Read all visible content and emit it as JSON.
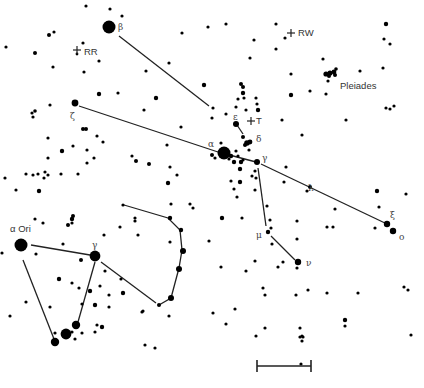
{
  "chart_title": "Star chart: Taurus / Auriga region with Orion",
  "colors": {
    "star": "#000000",
    "line": "#222222",
    "label": "#444444",
    "background": "#ffffff"
  },
  "labels": [
    {
      "id": "beta",
      "text": "β",
      "x": 118,
      "y": 30,
      "cls": "greek"
    },
    {
      "id": "zeta",
      "text": "ζ",
      "x": 70,
      "y": 119,
      "cls": "greek"
    },
    {
      "id": "alpha",
      "text": "α",
      "x": 208,
      "y": 147,
      "cls": "greek"
    },
    {
      "id": "epsilon",
      "text": "ε",
      "x": 233,
      "y": 120,
      "cls": "greek"
    },
    {
      "id": "delta",
      "text": "δ",
      "x": 256,
      "y": 142,
      "cls": "greek"
    },
    {
      "id": "gamma-tau",
      "text": "γ",
      "x": 262,
      "y": 161,
      "cls": "greek"
    },
    {
      "id": "lambda",
      "text": "λ",
      "x": 308,
      "y": 191,
      "cls": "greek"
    },
    {
      "id": "xi",
      "text": "ξ",
      "x": 390,
      "y": 218,
      "cls": "greek"
    },
    {
      "id": "omicron",
      "text": "o",
      "x": 399,
      "y": 240,
      "cls": "greek"
    },
    {
      "id": "mu",
      "text": "μ",
      "x": 256,
      "y": 238,
      "cls": "greek"
    },
    {
      "id": "nu",
      "text": "ν",
      "x": 306,
      "y": 266,
      "cls": "greek"
    },
    {
      "id": "gamma-ori",
      "text": "γ",
      "x": 92,
      "y": 248,
      "cls": "greek"
    },
    {
      "id": "alpha-ori",
      "text": "α Ori",
      "x": 10,
      "y": 232,
      "cls": "lbl-lg"
    },
    {
      "id": "rr",
      "text": "RR",
      "x": 84,
      "y": 55,
      "cls": "lbl-lg"
    },
    {
      "id": "rw",
      "text": "RW",
      "x": 298,
      "y": 36,
      "cls": "lbl-lg"
    },
    {
      "id": "t",
      "text": "T",
      "x": 256,
      "y": 124,
      "cls": "lbl-lg"
    },
    {
      "id": "pleiades",
      "text": "Pleiades",
      "x": 340,
      "y": 89,
      "cls": "lbl-lg"
    }
  ],
  "variables": [
    {
      "id": "RR",
      "x": 77,
      "y": 50
    },
    {
      "id": "RW",
      "x": 291,
      "y": 33
    },
    {
      "id": "T",
      "x": 251,
      "y": 121
    }
  ],
  "lines": [
    {
      "id": "beta-to-epsilon",
      "points": "119,36 209,106"
    },
    {
      "id": "epsilon-to-gamma-dash",
      "points": "237,125 243,134"
    },
    {
      "id": "zeta-to-alpha",
      "points": "79,106 218,152"
    },
    {
      "id": "alpha-to-gamma",
      "points": "218,152 256,162"
    },
    {
      "id": "gamma-to-xi",
      "points": "261,164 387,224"
    },
    {
      "id": "gamma-to-mu",
      "points": "258,168 266,226"
    },
    {
      "id": "mu-to-nu",
      "points": "271,236 295,260"
    },
    {
      "id": "alphaori-to-gammaori",
      "points": "31,245 90,255"
    },
    {
      "id": "alphaori-down",
      "points": "23,260 54,339"
    },
    {
      "id": "gammaori-down",
      "points": "95,262 78,322"
    },
    {
      "id": "gammaori-to-lower",
      "points": "101,262 156,303"
    },
    {
      "id": "orion-club",
      "points": "124,205 168,218 180,230 182,250 179,268 171,298 159,305"
    }
  ],
  "stars": [
    {
      "x": 109,
      "y": 27,
      "r": 6.5
    },
    {
      "x": 86,
      "y": 6,
      "r": 1.6
    },
    {
      "x": 110,
      "y": 9,
      "r": 1.6
    },
    {
      "x": 122,
      "y": 16,
      "r": 1.6
    },
    {
      "x": 49,
      "y": 35,
      "r": 2
    },
    {
      "x": 54,
      "y": 32,
      "r": 1.6
    },
    {
      "x": 35,
      "y": 53,
      "r": 2
    },
    {
      "x": 83,
      "y": 43,
      "r": 1.6
    },
    {
      "x": 77,
      "y": 54,
      "r": 1.4
    },
    {
      "x": 53,
      "y": 67,
      "r": 1.6
    },
    {
      "x": 99,
      "y": 61,
      "r": 1.6
    },
    {
      "x": 84,
      "y": 72,
      "r": 1.6
    },
    {
      "x": 169,
      "y": 63,
      "r": 1.6
    },
    {
      "x": 146,
      "y": 71,
      "r": 1.6
    },
    {
      "x": 182,
      "y": 33,
      "r": 1.6
    },
    {
      "x": 208,
      "y": 27,
      "r": 1.6
    },
    {
      "x": 204,
      "y": 85,
      "r": 2.2
    },
    {
      "x": 156,
      "y": 98,
      "r": 2.2
    },
    {
      "x": 99,
      "y": 94,
      "r": 2.2
    },
    {
      "x": 118,
      "y": 93,
      "r": 1.6
    },
    {
      "x": 75,
      "y": 103,
      "r": 3.4
    },
    {
      "x": 50,
      "y": 105,
      "r": 1.6
    },
    {
      "x": 35,
      "y": 111,
      "r": 1.8
    },
    {
      "x": 32,
      "y": 113,
      "r": 1.6
    },
    {
      "x": 33,
      "y": 117,
      "r": 1.6
    },
    {
      "x": 144,
      "y": 110,
      "r": 1.6
    },
    {
      "x": 181,
      "y": 127,
      "r": 1.6
    },
    {
      "x": 167,
      "y": 145,
      "r": 1.6
    },
    {
      "x": 83,
      "y": 129,
      "r": 2
    },
    {
      "x": 86,
      "y": 129,
      "r": 2
    },
    {
      "x": 97,
      "y": 136,
      "r": 1.6
    },
    {
      "x": 103,
      "y": 142,
      "r": 1.6
    },
    {
      "x": 48,
      "y": 138,
      "r": 1.6
    },
    {
      "x": 73,
      "y": 146,
      "r": 1.6
    },
    {
      "x": 62,
      "y": 151,
      "r": 2.2
    },
    {
      "x": 48,
      "y": 158,
      "r": 1.6
    },
    {
      "x": 132,
      "y": 156,
      "r": 1.6
    },
    {
      "x": 136,
      "y": 161,
      "r": 2
    },
    {
      "x": 149,
      "y": 164,
      "r": 2
    },
    {
      "x": 87,
      "y": 163,
      "r": 1.6
    },
    {
      "x": 94,
      "y": 158,
      "r": 1.6
    },
    {
      "x": 78,
      "y": 174,
      "r": 1.6
    },
    {
      "x": 170,
      "y": 167,
      "r": 1.6
    },
    {
      "x": 177,
      "y": 175,
      "r": 1.6
    },
    {
      "x": 168,
      "y": 183,
      "r": 2.2
    },
    {
      "x": 33,
      "y": 175,
      "r": 1.6
    },
    {
      "x": 38,
      "y": 174,
      "r": 1.6
    },
    {
      "x": 45,
      "y": 172,
      "r": 1.6
    },
    {
      "x": 44,
      "y": 178,
      "r": 1.6
    },
    {
      "x": 16,
      "y": 190,
      "r": 1.6
    },
    {
      "x": 39,
      "y": 191,
      "r": 2.2
    },
    {
      "x": 61,
      "y": 174,
      "r": 1.6
    },
    {
      "x": 87,
      "y": 150,
      "r": 1.6
    },
    {
      "x": 48,
      "y": 175,
      "r": 1.6
    },
    {
      "x": 26,
      "y": 174,
      "r": 1.6
    },
    {
      "x": 224,
      "y": 153,
      "r": 6.5
    },
    {
      "x": 212,
      "y": 155,
      "r": 2
    },
    {
      "x": 215,
      "y": 158,
      "r": 1.6
    },
    {
      "x": 231,
      "y": 156,
      "r": 2.2
    },
    {
      "x": 234,
      "y": 162,
      "r": 2.2
    },
    {
      "x": 229,
      "y": 159,
      "r": 1.6
    },
    {
      "x": 236,
      "y": 151,
      "r": 1.6
    },
    {
      "x": 241,
      "y": 162,
      "r": 2.2
    },
    {
      "x": 221,
      "y": 143,
      "r": 1.6
    },
    {
      "x": 212,
      "y": 118,
      "r": 1.6
    },
    {
      "x": 238,
      "y": 156,
      "r": 1.6
    },
    {
      "x": 243,
      "y": 160,
      "r": 1.6
    },
    {
      "x": 236,
      "y": 124,
      "r": 3
    },
    {
      "x": 243,
      "y": 137,
      "r": 2
    },
    {
      "x": 247,
      "y": 143,
      "r": 2.8
    },
    {
      "x": 250,
      "y": 142,
      "r": 2.4
    },
    {
      "x": 245,
      "y": 145,
      "r": 2
    },
    {
      "x": 249,
      "y": 150,
      "r": 1.6
    },
    {
      "x": 257,
      "y": 162,
      "r": 3
    },
    {
      "x": 255,
      "y": 171,
      "r": 1.6
    },
    {
      "x": 256,
      "y": 178,
      "r": 1.6
    },
    {
      "x": 252,
      "y": 176,
      "r": 1.6
    },
    {
      "x": 240,
      "y": 169,
      "r": 2.2
    },
    {
      "x": 240,
      "y": 182,
      "r": 2.2
    },
    {
      "x": 231,
      "y": 181,
      "r": 1.6
    },
    {
      "x": 234,
      "y": 189,
      "r": 1.6
    },
    {
      "x": 237,
      "y": 197,
      "r": 1.6
    },
    {
      "x": 255,
      "y": 190,
      "r": 1.6
    },
    {
      "x": 241,
      "y": 84,
      "r": 2
    },
    {
      "x": 243,
      "y": 87,
      "r": 2
    },
    {
      "x": 238,
      "y": 99,
      "r": 1.6
    },
    {
      "x": 243,
      "y": 93,
      "r": 2.2
    },
    {
      "x": 244,
      "y": 98,
      "r": 1.6
    },
    {
      "x": 246,
      "y": 110,
      "r": 1.6
    },
    {
      "x": 257,
      "y": 104,
      "r": 1.6
    },
    {
      "x": 256,
      "y": 98,
      "r": 1.6
    },
    {
      "x": 258,
      "y": 110,
      "r": 2.2
    },
    {
      "x": 236,
      "y": 107,
      "r": 1.6
    },
    {
      "x": 226,
      "y": 114,
      "r": 1.6
    },
    {
      "x": 213,
      "y": 108,
      "r": 1.6
    },
    {
      "x": 226,
      "y": 24,
      "r": 1.6
    },
    {
      "x": 254,
      "y": 40,
      "r": 1.6
    },
    {
      "x": 250,
      "y": 58,
      "r": 1.6
    },
    {
      "x": 276,
      "y": 24,
      "r": 1.6
    },
    {
      "x": 285,
      "y": 38,
      "r": 1.6
    },
    {
      "x": 276,
      "y": 49,
      "r": 1.6
    },
    {
      "x": 291,
      "y": 74,
      "r": 1.6
    },
    {
      "x": 291,
      "y": 95,
      "r": 2.2
    },
    {
      "x": 282,
      "y": 120,
      "r": 1.6
    },
    {
      "x": 302,
      "y": 135,
      "r": 1.6
    },
    {
      "x": 310,
      "y": 91,
      "r": 1.6
    },
    {
      "x": 323,
      "y": 59,
      "r": 1.6
    },
    {
      "x": 326,
      "y": 74,
      "r": 2.6
    },
    {
      "x": 330,
      "y": 73,
      "r": 2.6
    },
    {
      "x": 334,
      "y": 72,
      "r": 2.4
    },
    {
      "x": 336,
      "y": 69,
      "r": 1.8
    },
    {
      "x": 335,
      "y": 75,
      "r": 2
    },
    {
      "x": 329,
      "y": 76,
      "r": 2
    },
    {
      "x": 328,
      "y": 81,
      "r": 1.6
    },
    {
      "x": 326,
      "y": 94,
      "r": 1.6
    },
    {
      "x": 360,
      "y": 71,
      "r": 1.6
    },
    {
      "x": 386,
      "y": 24,
      "r": 2.2
    },
    {
      "x": 384,
      "y": 39,
      "r": 1.6
    },
    {
      "x": 390,
      "y": 44,
      "r": 1.6
    },
    {
      "x": 383,
      "y": 68,
      "r": 1.6
    },
    {
      "x": 386,
      "y": 108,
      "r": 1.6
    },
    {
      "x": 390,
      "y": 109,
      "r": 1.6
    },
    {
      "x": 394,
      "y": 106,
      "r": 1.6
    },
    {
      "x": 346,
      "y": 120,
      "r": 1.6
    },
    {
      "x": 286,
      "y": 167,
      "r": 1.6
    },
    {
      "x": 307,
      "y": 191,
      "r": 1.6
    },
    {
      "x": 377,
      "y": 191,
      "r": 2.2
    },
    {
      "x": 310,
      "y": 187,
      "r": 2
    },
    {
      "x": 335,
      "y": 209,
      "r": 1.6
    },
    {
      "x": 379,
      "y": 207,
      "r": 1.6
    },
    {
      "x": 387,
      "y": 224,
      "r": 3.2
    },
    {
      "x": 393,
      "y": 231,
      "r": 3.2
    },
    {
      "x": 375,
      "y": 228,
      "r": 1.6
    },
    {
      "x": 267,
      "y": 206,
      "r": 1.6
    },
    {
      "x": 242,
      "y": 218,
      "r": 1.6
    },
    {
      "x": 222,
      "y": 218,
      "r": 2.2
    },
    {
      "x": 270,
      "y": 220,
      "r": 1.6
    },
    {
      "x": 271,
      "y": 228,
      "r": 1.6
    },
    {
      "x": 268,
      "y": 232,
      "r": 2.2
    },
    {
      "x": 272,
      "y": 244,
      "r": 1.6
    },
    {
      "x": 297,
      "y": 221,
      "r": 1.6
    },
    {
      "x": 297,
      "y": 239,
      "r": 1.6
    },
    {
      "x": 327,
      "y": 227,
      "r": 1.6
    },
    {
      "x": 255,
      "y": 261,
      "r": 1.6
    },
    {
      "x": 278,
      "y": 267,
      "r": 1.6
    },
    {
      "x": 298,
      "y": 262,
      "r": 3.2
    },
    {
      "x": 297,
      "y": 268,
      "r": 1.6
    },
    {
      "x": 221,
      "y": 267,
      "r": 1.6
    },
    {
      "x": 246,
      "y": 271,
      "r": 1.6
    },
    {
      "x": 263,
      "y": 288,
      "r": 1.6
    },
    {
      "x": 283,
      "y": 262,
      "r": 1.6
    },
    {
      "x": 308,
      "y": 290,
      "r": 1.6
    },
    {
      "x": 327,
      "y": 293,
      "r": 1.6
    },
    {
      "x": 358,
      "y": 293,
      "r": 1.6
    },
    {
      "x": 404,
      "y": 287,
      "r": 1.6
    },
    {
      "x": 408,
      "y": 290,
      "r": 1.6
    },
    {
      "x": 296,
      "y": 295,
      "r": 1.6
    },
    {
      "x": 213,
      "y": 313,
      "r": 1.6
    },
    {
      "x": 235,
      "y": 309,
      "r": 1.6
    },
    {
      "x": 226,
      "y": 324,
      "r": 1.6
    },
    {
      "x": 265,
      "y": 295,
      "r": 1.6
    },
    {
      "x": 300,
      "y": 328,
      "r": 1.6
    },
    {
      "x": 300,
      "y": 337,
      "r": 1.6
    },
    {
      "x": 265,
      "y": 328,
      "r": 1.6
    },
    {
      "x": 303,
      "y": 337,
      "r": 1.6
    },
    {
      "x": 345,
      "y": 320,
      "r": 2.2
    },
    {
      "x": 345,
      "y": 326,
      "r": 1.6
    },
    {
      "x": 411,
      "y": 335,
      "r": 1.6
    },
    {
      "x": 302,
      "y": 336,
      "r": 1.6
    },
    {
      "x": 301,
      "y": 364,
      "r": 1.6
    },
    {
      "x": 256,
      "y": 336,
      "r": 1.6
    },
    {
      "x": 302,
      "y": 341,
      "r": 1.6
    },
    {
      "x": 21,
      "y": 245,
      "r": 6.5
    },
    {
      "x": 95,
      "y": 256,
      "r": 5.4
    },
    {
      "x": 36,
      "y": 254,
      "r": 1.6
    },
    {
      "x": 63,
      "y": 244,
      "r": 1.6
    },
    {
      "x": 81,
      "y": 260,
      "r": 2
    },
    {
      "x": 72,
      "y": 219,
      "r": 2.2
    },
    {
      "x": 73,
      "y": 216,
      "r": 2
    },
    {
      "x": 72,
      "y": 223,
      "r": 1.6
    },
    {
      "x": 68,
      "y": 225,
      "r": 2
    },
    {
      "x": 35,
      "y": 219,
      "r": 1.6
    },
    {
      "x": 43,
      "y": 223,
      "r": 1.6
    },
    {
      "x": 135,
      "y": 221,
      "r": 1.6
    },
    {
      "x": 104,
      "y": 235,
      "r": 1.6
    },
    {
      "x": 120,
      "y": 227,
      "r": 1.6
    },
    {
      "x": 138,
      "y": 235,
      "r": 1.6
    },
    {
      "x": 105,
      "y": 271,
      "r": 1.6
    },
    {
      "x": 59,
      "y": 279,
      "r": 2.2
    },
    {
      "x": 72,
      "y": 283,
      "r": 1.6
    },
    {
      "x": 79,
      "y": 288,
      "r": 1.6
    },
    {
      "x": 90,
      "y": 291,
      "r": 2.2
    },
    {
      "x": 100,
      "y": 286,
      "r": 1.6
    },
    {
      "x": 109,
      "y": 295,
      "r": 1.6
    },
    {
      "x": 123,
      "y": 293,
      "r": 2.2
    },
    {
      "x": 95,
      "y": 305,
      "r": 2.2
    },
    {
      "x": 82,
      "y": 304,
      "r": 1.6
    },
    {
      "x": 26,
      "y": 302,
      "r": 1.6
    },
    {
      "x": 50,
      "y": 307,
      "r": 1.6
    },
    {
      "x": 10,
      "y": 316,
      "r": 1.6
    },
    {
      "x": 76,
      "y": 325,
      "r": 4.2
    },
    {
      "x": 66,
      "y": 334,
      "r": 5.4
    },
    {
      "x": 55,
      "y": 342,
      "r": 4.2
    },
    {
      "x": 72,
      "y": 332,
      "r": 1.6
    },
    {
      "x": 55,
      "y": 333,
      "r": 1.6
    },
    {
      "x": 75,
      "y": 339,
      "r": 1.6
    },
    {
      "x": 82,
      "y": 333,
      "r": 1.6
    },
    {
      "x": 97,
      "y": 325,
      "r": 1.6
    },
    {
      "x": 102,
      "y": 327,
      "r": 2.2
    },
    {
      "x": 95,
      "y": 332,
      "r": 1.6
    },
    {
      "x": 145,
      "y": 345,
      "r": 1.6
    },
    {
      "x": 123,
      "y": 205,
      "r": 1.6
    },
    {
      "x": 135,
      "y": 218,
      "r": 1.6
    },
    {
      "x": 171,
      "y": 204,
      "r": 1.6
    },
    {
      "x": 190,
      "y": 204,
      "r": 1.6
    },
    {
      "x": 193,
      "y": 208,
      "r": 1.6
    },
    {
      "x": 170,
      "y": 218,
      "r": 2.2
    },
    {
      "x": 181,
      "y": 230,
      "r": 2.2
    },
    {
      "x": 183,
      "y": 251,
      "r": 3
    },
    {
      "x": 179,
      "y": 269,
      "r": 3
    },
    {
      "x": 171,
      "y": 298,
      "r": 3
    },
    {
      "x": 159,
      "y": 305,
      "r": 2
    },
    {
      "x": 170,
      "y": 242,
      "r": 1.6
    },
    {
      "x": 209,
      "y": 241,
      "r": 1.6
    },
    {
      "x": 169,
      "y": 316,
      "r": 1.6
    },
    {
      "x": 143,
      "y": 311,
      "r": 1.6
    },
    {
      "x": 155,
      "y": 348,
      "r": 1.6
    },
    {
      "x": 121,
      "y": 279,
      "r": 1.6
    },
    {
      "x": 142,
      "y": 312,
      "r": 1.6
    },
    {
      "x": 109,
      "y": 307,
      "r": 1.6
    },
    {
      "x": 6,
      "y": 47,
      "r": 1.6
    },
    {
      "x": 5,
      "y": 178,
      "r": 1.6
    },
    {
      "x": 2,
      "y": 253,
      "r": 1.6
    },
    {
      "x": 333,
      "y": 227,
      "r": 1.6
    },
    {
      "x": 284,
      "y": 182,
      "r": 1.6
    },
    {
      "x": 406,
      "y": 194,
      "r": 1.6
    }
  ],
  "scale_bar": {
    "x1": 257,
    "x2": 311,
    "y": 366,
    "tick_half": 6
  }
}
